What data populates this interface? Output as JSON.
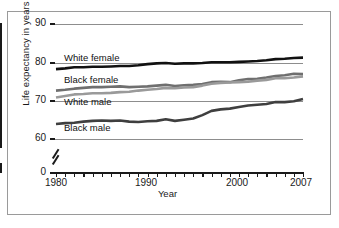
{
  "chart_data": {
    "type": "line",
    "title": "",
    "xlabel": "Year",
    "ylabel": "Life expectancy in years",
    "xlim": [
      1980,
      2007
    ],
    "ylim": [
      60,
      90
    ],
    "y_axis_break": true,
    "y_break_between": [
      0,
      60
    ],
    "grid": true,
    "grid_axis": "y",
    "legend": "inline-labels",
    "ytick_labels": [
      "90",
      "80",
      "70",
      "60",
      "0"
    ],
    "ytick_values": [
      90,
      80,
      70,
      60,
      0
    ],
    "xtick_labels": [
      "1980",
      "1990",
      "2000",
      "2007"
    ],
    "xtick_values": [
      1980,
      1990,
      2000,
      2007
    ],
    "x_minor_ticks_every": 1,
    "x": [
      1980,
      1981,
      1982,
      1983,
      1984,
      1985,
      1986,
      1987,
      1988,
      1989,
      1990,
      1991,
      1992,
      1993,
      1994,
      1995,
      1996,
      1997,
      1998,
      1999,
      2000,
      2001,
      2002,
      2003,
      2004,
      2005,
      2006,
      2007
    ],
    "series": [
      {
        "name": "White female",
        "color": "#111111",
        "label_text": "White female",
        "values": [
          78.1,
          78.3,
          78.6,
          78.6,
          78.7,
          78.7,
          78.8,
          78.9,
          78.9,
          79.1,
          79.4,
          79.6,
          79.7,
          79.5,
          79.6,
          79.6,
          79.7,
          79.9,
          79.9,
          79.9,
          80.0,
          80.1,
          80.2,
          80.4,
          80.7,
          80.8,
          81.0,
          81.1
        ],
        "start_value": 78.1,
        "end_value": 81.1
      },
      {
        "name": "Black female",
        "color": "#6f6f6f",
        "label_text": "Black female",
        "values": [
          72.5,
          72.7,
          73.0,
          73.2,
          73.4,
          73.4,
          73.5,
          73.6,
          73.4,
          73.5,
          73.6,
          73.8,
          74.0,
          73.7,
          73.9,
          74.0,
          74.2,
          74.7,
          74.8,
          74.7,
          75.2,
          75.5,
          75.6,
          75.9,
          76.3,
          76.5,
          76.9,
          76.8
        ],
        "start_value": 72.5,
        "end_value": 76.8
      },
      {
        "name": "White male",
        "color": "#9a9a9a",
        "label_text": "White male",
        "values": [
          70.7,
          71.1,
          71.5,
          71.6,
          71.8,
          71.8,
          71.9,
          72.1,
          72.2,
          72.5,
          72.7,
          72.9,
          73.2,
          73.1,
          73.3,
          73.4,
          73.8,
          74.3,
          74.5,
          74.6,
          74.7,
          74.8,
          75.1,
          75.3,
          75.7,
          75.7,
          75.9,
          76.2
        ],
        "start_value": 70.7,
        "end_value": 76.2
      },
      {
        "name": "Black male",
        "color": "#3f3f3f",
        "label_text": "Black male",
        "values": [
          63.8,
          64.0,
          64.1,
          64.4,
          64.6,
          64.7,
          64.6,
          64.7,
          64.4,
          64.3,
          64.5,
          64.6,
          65.0,
          64.6,
          64.9,
          65.2,
          66.1,
          67.2,
          67.6,
          67.8,
          68.2,
          68.6,
          68.8,
          69.0,
          69.5,
          69.5,
          69.7,
          70.3
        ],
        "start_value": 63.8,
        "end_value": 70.3
      }
    ]
  },
  "labels": {
    "y_axis_title": "Life expectancy in years",
    "x_axis_title": "Year",
    "series_white_female": "White female",
    "series_black_female": "Black female",
    "series_white_male": "White male",
    "series_black_male": "Black male",
    "ytick_90": "90",
    "ytick_80": "80",
    "ytick_70": "70",
    "ytick_60": "60",
    "ytick_0": "0",
    "xtick_1980": "1980",
    "xtick_1990": "1990",
    "xtick_2000": "2000",
    "xtick_2007": "2007"
  }
}
